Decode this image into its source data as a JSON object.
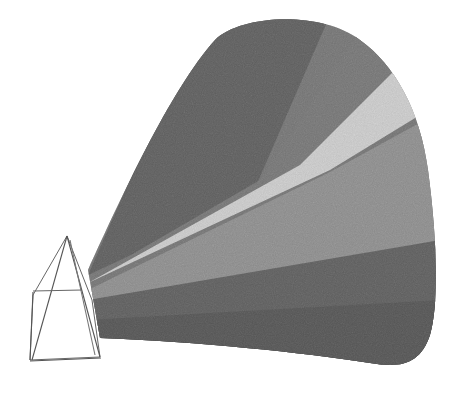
{
  "image": {
    "description": "Pencil drawing of a glass prism with a widening beam of light emerging to the right",
    "subject": "prism-light-beam",
    "colors": {
      "background": "#ffffff",
      "beam_dark": "#3a3a3a",
      "beam_mid": "#7a7a7a",
      "beam_light": "#e8e8e8",
      "prism_stroke": "#555555"
    }
  }
}
